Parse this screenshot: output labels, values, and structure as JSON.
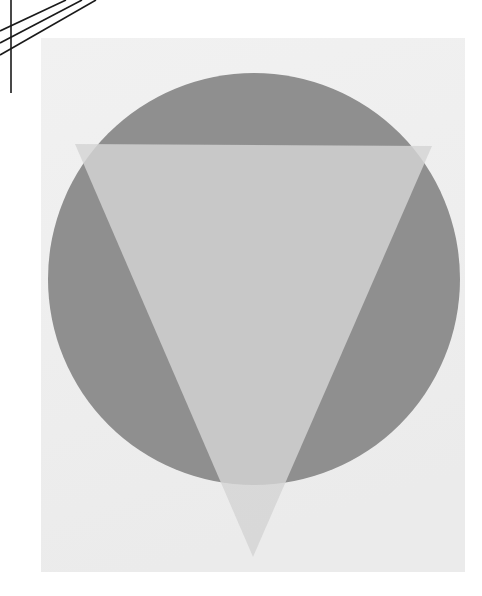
{
  "canvas": {
    "width": 482,
    "height": 596,
    "background_color": "#ffffff",
    "title": "Scanned geometric composition: gray circle with overlapping inverted triangle"
  },
  "paper": {
    "label": "paper-sheet",
    "x": 41,
    "y": 38,
    "width": 424,
    "height": 534,
    "color": "#efefef",
    "edge_shadow_color": "#e4e4e4"
  },
  "shapes": [
    {
      "name": "circle",
      "type": "circle",
      "cx": 254,
      "cy": 279,
      "r": 206,
      "color": "#8f8f8f",
      "opacity": 1
    },
    {
      "name": "inverted-triangle",
      "type": "polygon",
      "points": "75,144 432,146 253,557",
      "color": "#d4d4d4",
      "opacity": 0.82,
      "blend_color_over_circle": "#c2c2c2",
      "blend_color_over_paper": "#d0d0d0"
    }
  ],
  "registration_marks": {
    "label": "corner-registration-lines",
    "color": "#1a1a1a",
    "stroke_width": 1.6,
    "lines": [
      {
        "name": "vertical-rule",
        "x1": 11,
        "y1": 0,
        "x2": 11,
        "y2": 93
      },
      {
        "name": "diagonal-rule-1",
        "x1": 0,
        "y1": 31,
        "x2": 66,
        "y2": 0
      },
      {
        "name": "diagonal-rule-2",
        "x1": 0,
        "y1": 43,
        "x2": 82,
        "y2": 0
      },
      {
        "name": "diagonal-rule-3",
        "x1": 0,
        "y1": 55,
        "x2": 96,
        "y2": 0
      }
    ]
  }
}
